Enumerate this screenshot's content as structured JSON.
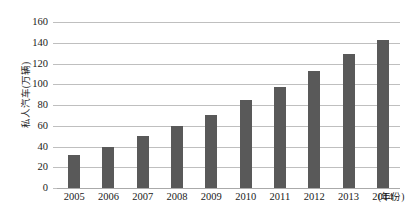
{
  "chart_data": {
    "type": "bar",
    "title": "",
    "subtitle": "",
    "xlabel": "(年份)",
    "ylabel": "私人汽车(万辆)",
    "categories": [
      "2005",
      "2006",
      "2007",
      "2008",
      "2009",
      "2010",
      "2011",
      "2012",
      "2013",
      "2014"
    ],
    "values": [
      32,
      40,
      50,
      60,
      70,
      85,
      97,
      113,
      129,
      143
    ],
    "series": [
      {
        "name": "私人汽车(万辆)",
        "values": [
          32,
          40,
          50,
          60,
          70,
          85,
          97,
          113,
          129,
          143
        ]
      }
    ],
    "ylim": [
      0,
      160
    ],
    "ytick_values": [
      0,
      20,
      40,
      60,
      80,
      100,
      120,
      140,
      160
    ],
    "ytick_labels": [
      "0",
      "20",
      "40",
      "60",
      "80",
      "100",
      "120",
      "140",
      "160"
    ],
    "grid": "horizontal",
    "legend": "none",
    "bar_color": "#595959",
    "gridline_color": "#bfbfbf",
    "background_color": "#ffffff",
    "text_color": "#1a1a1a"
  }
}
